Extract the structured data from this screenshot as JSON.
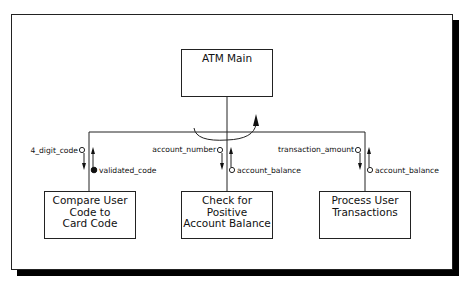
{
  "diagram": {
    "type": "structure-chart",
    "root": {
      "label": "ATM Main"
    },
    "children": [
      {
        "label_lines": [
          "Compare User",
          "Code to",
          "Card Code"
        ],
        "in_couple": {
          "label": "4_digit_code",
          "kind": "data"
        },
        "out_couple": {
          "label": "validated_code",
          "kind": "control"
        }
      },
      {
        "label_lines": [
          "Check for",
          "Positive",
          "Account Balance"
        ],
        "in_couple": {
          "label": "account_number",
          "kind": "data"
        },
        "out_couple": {
          "label": "account_balance",
          "kind": "data"
        }
      },
      {
        "label_lines": [
          "Process User",
          "Transactions"
        ],
        "in_couple": {
          "label": "transaction_amount",
          "kind": "data"
        },
        "out_couple": {
          "label": "account_balance",
          "kind": "data"
        }
      }
    ],
    "loop_indicator": "iteration-arrow"
  },
  "colors": {
    "stroke": "#222222",
    "shadow": "#000000",
    "background": "#ffffff"
  }
}
